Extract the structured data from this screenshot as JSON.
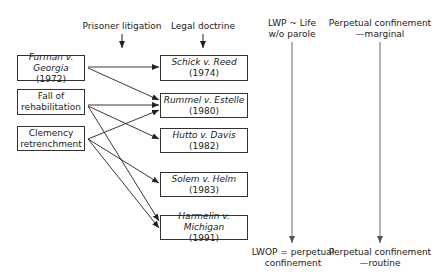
{
  "headers": {
    "prisoner_litigation": "Prisoner litigation",
    "legal_doctrine": "Legal doctrine",
    "lwp_top_line1": "LWP ~ Life",
    "lwp_top_line2": "w/o parole",
    "perpetual_top_line1": "Perpetual confinement",
    "perpetual_top_line2": "—marginal",
    "lwop_bottom_line1": "LWOP = perpetual",
    "lwop_bottom_line2": "confinement",
    "perpetual_bottom_line1": "Perpetual confinement",
    "perpetual_bottom_line2": "—routine"
  },
  "causes": [
    {
      "id": "furman",
      "line1_italic": "Furman v.",
      "line2_italic": "Georgia",
      "line2_rest": " (1972)"
    },
    {
      "id": "fall",
      "line1": "Fall of",
      "line2": "rehabilitation"
    },
    {
      "id": "clemency",
      "line1": "Clemency",
      "line2": "retrenchment"
    }
  ],
  "cases": [
    {
      "id": "schick",
      "name": "Schick v. Reed",
      "year": "(1974)"
    },
    {
      "id": "rummel",
      "name": "Rummel v. Estelle",
      "year": "(1980)"
    },
    {
      "id": "hutto",
      "name": "Hutto v. Davis",
      "year": "(1982)"
    },
    {
      "id": "solem",
      "name": "Solem v. Helm",
      "year": "(1983)"
    },
    {
      "id": "harmelin",
      "name": "Harmelin v. Michigan",
      "year": "(1991)"
    }
  ],
  "edges": [
    {
      "from": "furman",
      "to": "schick"
    },
    {
      "from": "furman",
      "to": "rummel"
    },
    {
      "from": "fall",
      "to": "rummel"
    },
    {
      "from": "fall",
      "to": "hutto"
    },
    {
      "from": "fall",
      "to": "harmelin"
    },
    {
      "from": "clemency",
      "to": "rummel"
    },
    {
      "from": "clemency",
      "to": "solem"
    },
    {
      "from": "clemency",
      "to": "harmelin"
    }
  ],
  "colors": {
    "box_border": "#333333",
    "arrow": "#222222",
    "timeline": "#666666"
  }
}
